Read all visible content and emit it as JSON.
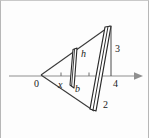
{
  "figure": {
    "background_color": "#fdfdfd",
    "border_color": "#b7b7b7",
    "stroke_color": "#2b2b2b",
    "axis_color": "#8f8f8f",
    "axis": {
      "name": "x-axis",
      "y_pixel": 75,
      "x_start_pixel": 8,
      "x_end_pixel": 140,
      "has_right_arrow": true,
      "ticks": [
        {
          "label": "x",
          "x_pixel": 60
        },
        {
          "label": "",
          "x_pixel": 88
        }
      ]
    },
    "labels": [
      {
        "id": "origin",
        "text": "0",
        "x": 33,
        "y": 78,
        "italic": false
      },
      {
        "id": "x-variable",
        "text": "x",
        "x": 57,
        "y": 80,
        "italic": true
      },
      {
        "id": "height-h",
        "text": "h",
        "x": 80,
        "y": 50,
        "italic": true
      },
      {
        "id": "base-b",
        "text": "b",
        "x": 74,
        "y": 84,
        "italic": true
      },
      {
        "id": "value-3",
        "text": "3",
        "x": 114,
        "y": 44,
        "italic": false
      },
      {
        "id": "value-4",
        "text": "4",
        "x": 112,
        "y": 79,
        "italic": false
      },
      {
        "id": "value-2",
        "text": "2",
        "x": 102,
        "y": 100,
        "italic": false
      }
    ],
    "geometry": {
      "origin_vertex": {
        "x": 40,
        "y": 74
      },
      "top_vertex": {
        "x": 109,
        "y": 25
      },
      "bottom_vertex": {
        "x": 93,
        "y": 110
      },
      "right_edge_top": {
        "x": 109,
        "y": 25
      },
      "right_edge_bottom": {
        "x": 93,
        "y": 110
      },
      "slice_at_x": {
        "top": {
          "x": 73,
          "y": 49
        },
        "axis": {
          "x": 70,
          "y": 74
        },
        "bottom": {
          "x": 68,
          "y": 84
        },
        "width_px": 4
      },
      "slice_at_4": {
        "top": {
          "x": 106,
          "y": 26
        },
        "axis": {
          "x": 101,
          "y": 75
        },
        "bottom": {
          "x": 94,
          "y": 109
        },
        "width_px": 6
      }
    }
  }
}
